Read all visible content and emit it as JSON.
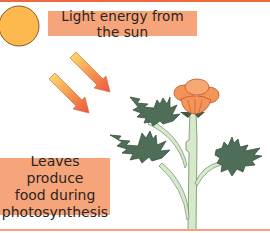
{
  "diagram": {
    "topic": "Photosynthesis",
    "labels": {
      "light": "Light energy from the sun",
      "leaves_line1": "Leaves produce",
      "leaves_line2": "food during",
      "leaves_line3": "photosynthesis"
    },
    "elements": [
      "sun-icon",
      "light-arrow",
      "light-arrow",
      "flowering-plant"
    ],
    "colors": {
      "label_bg": "#F6A57A",
      "top_rule": "#EE6A3E",
      "bottom_rule": "#F4A07A",
      "sun_fill": "#FDB84E",
      "sun_outline": "#8A5A2A",
      "arrow_start": "#FBE06A",
      "arrow_end": "#F0553A",
      "leaf_fill": "#4E6E58",
      "leaf_outline": "#2F4535",
      "stem_fill": "#D6E9C9",
      "stem_outline": "#6E8A6A",
      "flower_fill": "#F39559",
      "flower_outline": "#C4532A"
    }
  }
}
